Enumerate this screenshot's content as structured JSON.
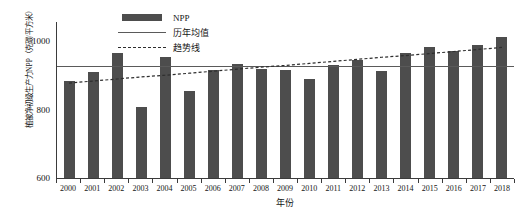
{
  "chart_data": {
    "type": "bar",
    "title": "",
    "xlabel": "年份",
    "ylabel": "植被净初级生产力NPP（克碳/平方米）",
    "categories": [
      "2000",
      "2001",
      "2002",
      "2003",
      "2004",
      "2005",
      "2006",
      "2007",
      "2008",
      "2009",
      "2010",
      "2011",
      "2012",
      "2013",
      "2014",
      "2015",
      "2016",
      "2017",
      "2018"
    ],
    "values": [
      884,
      912,
      965,
      808,
      955,
      855,
      917,
      935,
      918,
      916,
      891,
      930,
      946,
      915,
      965,
      985,
      972,
      990,
      1013
    ],
    "series": [
      {
        "name": "NPP",
        "type": "bar",
        "color": "#4d4d4d",
        "values": [
          884,
          912,
          965,
          808,
          955,
          855,
          917,
          935,
          918,
          916,
          891,
          930,
          946,
          915,
          965,
          985,
          972,
          990,
          1013
        ]
      },
      {
        "name": "历年均值",
        "type": "line",
        "style": "solid",
        "color": "#5a5a5a",
        "value": 929,
        "values": [
          929,
          929,
          929,
          929,
          929,
          929,
          929,
          929,
          929,
          929,
          929,
          929,
          929,
          929,
          929,
          929,
          929,
          929,
          929
        ]
      },
      {
        "name": "趋势线",
        "type": "line",
        "style": "dashed",
        "color": "#2e2e2e",
        "values": [
          880,
          886,
          892,
          898,
          903,
          909,
          915,
          921,
          927,
          932,
          938,
          944,
          950,
          956,
          961,
          967,
          973,
          979,
          985
        ]
      }
    ],
    "ylim": [
      600,
      1060
    ],
    "yticks": [
      600,
      800,
      1000
    ],
    "ytick_labels": [
      "600",
      "800",
      "1000"
    ],
    "xlim": [
      "2000",
      "2018"
    ],
    "grid": false,
    "legend_position": "top-left-inside",
    "legend_entries": [
      "NPP",
      "历年均值",
      "趋势线"
    ]
  },
  "axes": {
    "y_title": "植被净初级生产力NPP（克碳/平方米）",
    "x_title": "年份",
    "y_ticks": [
      "1000",
      "800",
      "600"
    ]
  },
  "legend": {
    "items": [
      {
        "label": "NPP",
        "key": "bar-swatch"
      },
      {
        "label": "历年均值",
        "key": "solid-line-swatch"
      },
      {
        "label": "趋势线",
        "key": "dashed-line-swatch"
      }
    ]
  }
}
